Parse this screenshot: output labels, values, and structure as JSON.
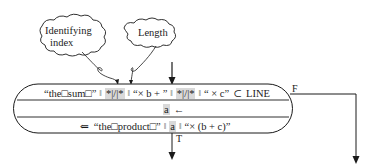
{
  "clouds": [
    {
      "id": "identifying-index",
      "lines": [
        "Identifying",
        "index"
      ]
    },
    {
      "id": "length",
      "lines": [
        "Length"
      ]
    }
  ],
  "box": {
    "row1": {
      "tokens": [
        {
          "text": "“the□sum□”",
          "highlight": false
        },
        {
          "text": "‖",
          "highlight": false,
          "separator": true
        },
        {
          "text": "*|/|*",
          "highlight": true
        },
        {
          "text": "‖",
          "highlight": false,
          "separator": true
        },
        {
          "text": "“× b + ”",
          "highlight": false
        },
        {
          "text": "‖",
          "highlight": false,
          "separator": true
        },
        {
          "text": "*|/|*",
          "highlight": true
        },
        {
          "text": "‖",
          "highlight": false,
          "separator": true
        },
        {
          "text": "“ ×  c”",
          "highlight": false
        },
        {
          "text": "⊂",
          "highlight": false
        },
        {
          "text": "LINE",
          "highlight": false
        }
      ]
    },
    "row2": {
      "variable": "a",
      "arrow": "←"
    },
    "row3": {
      "tokens": [
        {
          "text": "⇐",
          "highlight": false
        },
        {
          "text": "“the□product□”",
          "highlight": false
        },
        {
          "text": "‖",
          "highlight": false,
          "separator": true
        },
        {
          "text": "a",
          "highlight": true
        },
        {
          "text": "‖",
          "highlight": false,
          "separator": true
        },
        {
          "text": "“× (b + c)”",
          "highlight": false
        }
      ]
    }
  },
  "branches": {
    "true_label": "T",
    "false_label": "F"
  },
  "colors": {
    "line": "#1a1a1a",
    "highlight": "#d9d9d9",
    "background": "#ffffff"
  }
}
